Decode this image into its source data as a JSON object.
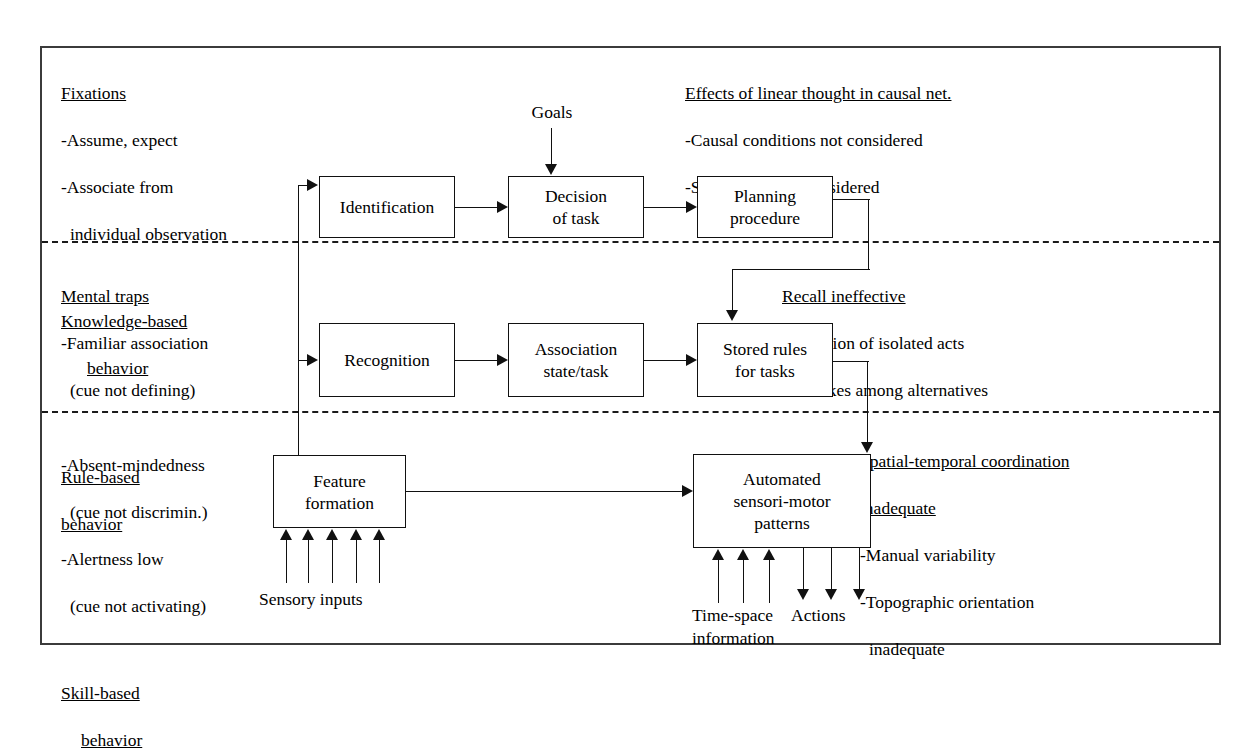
{
  "diagram": {
    "frame": {
      "border_color": "#3b3b3b"
    },
    "panels": {
      "knowledge_left": {
        "heading": "Fixations",
        "bullets": [
          "-Assume, expect",
          "-Associate from",
          "individual observation"
        ],
        "level_label_line1": "Knowledge-based",
        "level_label_line2": "behavior"
      },
      "knowledge_right": {
        "heading": "Effects of linear thought in causal net.",
        "bullets": [
          "-Causal conditions not considered",
          "-Side effects not considered"
        ]
      },
      "rule_left": {
        "heading": "Mental traps",
        "bullets": [
          "-Familiar association",
          "(cue not defining)"
        ],
        "level_label_line1": "Rule-based",
        "level_label_line2": "behavior"
      },
      "rule_right": {
        "heading": "Recall ineffective",
        "bullets": [
          "-Omission of isolated acts",
          "-Mistakes among alternatives"
        ]
      },
      "skill_left": {
        "bullets": [
          "-Absent-mindedness",
          "(cue not discrimin.)",
          "-Alertness low",
          "(cue not activating)"
        ],
        "level_label_line1": "Skill-based",
        "level_label_line2": "behavior"
      },
      "skill_right": {
        "heading_line1": "Spatial-temporal coordination",
        "heading_line2": "inadequate",
        "bullets": [
          "-Manual variability",
          "-Topographic orientation",
          "inadequate"
        ]
      }
    },
    "boxes": {
      "identification": "Identification",
      "decision_of_task": "Decision\nof task",
      "planning_procedure": "Planning\nprocedure",
      "recognition": "Recognition",
      "association_state_task": "Association\nstate/task",
      "stored_rules": "Stored rules\nfor tasks",
      "feature_formation": "Feature\nformation",
      "automated_patterns": "Automated\nsensori-motor\npatterns"
    },
    "labels": {
      "goals": "Goals",
      "sensory_inputs": "Sensory inputs",
      "time_space_information": "Time-space\ninformation",
      "actions": "Actions"
    }
  }
}
